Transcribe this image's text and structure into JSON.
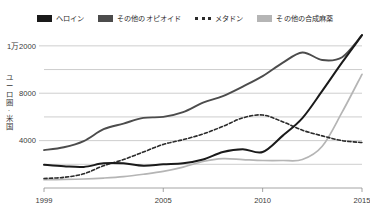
{
  "chart_data": {
    "type": "line",
    "title": "",
    "subtitle": "",
    "xlabel": "",
    "ylabel": "ユーロ圏·米国",
    "x": [
      1999,
      2000,
      2001,
      2002,
      2003,
      2004,
      2005,
      2006,
      2007,
      2008,
      2009,
      2010,
      2011,
      2012,
      2013,
      2014,
      2015
    ],
    "xlim": [
      1999,
      2015
    ],
    "ylim": [
      0,
      13000
    ],
    "grid": true,
    "gridlines": [
      2000,
      4000,
      6000,
      8000,
      10000,
      12000
    ],
    "xticks": [
      1999,
      2005,
      2010,
      2015
    ],
    "xtick_labels": [
      "1999",
      "2005",
      "2010",
      "2015"
    ],
    "yticks": [
      4000,
      8000,
      12000
    ],
    "ytick_labels": [
      "4000",
      "8000",
      "1万2000"
    ],
    "legend_position": "top-center",
    "series": [
      {
        "name": "ヘロイン",
        "color": "#1a1a1a",
        "style": "solid",
        "width": 2.0,
        "values": [
          1960,
          1840,
          1780,
          2080,
          2080,
          1880,
          2000,
          2080,
          2400,
          3040,
          3280,
          3040,
          4400,
          5900,
          8200,
          10600,
          12900
        ]
      },
      {
        "name": "その他のオピオイド",
        "color": "#4c4c4c",
        "style": "solid",
        "width": 1.9,
        "values": [
          3200,
          3440,
          3960,
          4960,
          5440,
          5920,
          6000,
          6400,
          7200,
          7760,
          8560,
          9440,
          10560,
          11440,
          10800,
          11040,
          12900
        ]
      },
      {
        "name": "メタドン",
        "color": "#2b2b2b",
        "style": "dashed",
        "width": 1.6,
        "values": [
          800,
          900,
          1200,
          1880,
          2400,
          3040,
          3680,
          4080,
          4560,
          5200,
          5920,
          6160,
          5600,
          4880,
          4400,
          4000,
          3840
        ]
      },
      {
        "name": "その他の合成麻薬",
        "color": "#b5b5b5",
        "style": "solid",
        "width": 1.7,
        "values": [
          700,
          720,
          760,
          840,
          960,
          1160,
          1400,
          1760,
          2240,
          2480,
          2400,
          2320,
          2320,
          2400,
          3520,
          6400,
          9600
        ]
      }
    ]
  },
  "legend": {
    "items": [
      {
        "label": "ヘロイン",
        "swatch": "#1a1a1a",
        "kind": "solid"
      },
      {
        "label": "その他のオピオイド",
        "swatch": "#4c4c4c",
        "kind": "solid"
      },
      {
        "label": "メタドン",
        "swatch": "#2b2b2b",
        "kind": "dashed"
      },
      {
        "label": "その他の合成麻薬",
        "swatch": "#b5b5b5",
        "kind": "solid"
      }
    ]
  },
  "axes": {
    "y_title": "ユーロ圏·米国",
    "y_tick_labels": [
      "1万2000",
      "8000",
      "4000"
    ],
    "x_tick_labels": [
      "1999",
      "2005",
      "2010",
      "2015"
    ]
  }
}
